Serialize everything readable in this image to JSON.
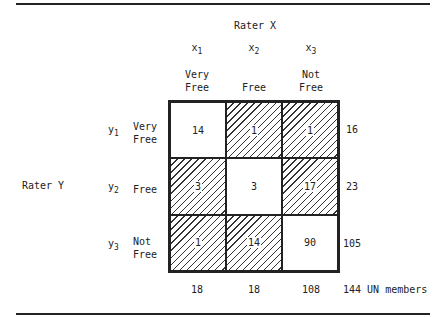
{
  "rater_x": {
    "label": "Rater X"
  },
  "rater_y": {
    "label": "Rater Y"
  },
  "columns": [
    {
      "var": "x",
      "sub": "1",
      "label1": "Very",
      "label2": "Free"
    },
    {
      "var": "x",
      "sub": "2",
      "label1": "",
      "label2": "Free"
    },
    {
      "var": "x",
      "sub": "3",
      "label1": "Not",
      "label2": "Free"
    }
  ],
  "rows": [
    {
      "var": "y",
      "sub": "1",
      "label1": "Very",
      "label2": "Free",
      "total": "16"
    },
    {
      "var": "y",
      "sub": "2",
      "label1": "",
      "label2": "Free",
      "total": "23"
    },
    {
      "var": "y",
      "sub": "3",
      "label1": "Not",
      "label2": "Free",
      "total": "105"
    }
  ],
  "cells": [
    [
      "14",
      "1",
      "1"
    ],
    [
      "3",
      "3",
      "17"
    ],
    [
      "1",
      "14",
      "90"
    ]
  ],
  "column_totals": [
    "18",
    "18",
    "108"
  ],
  "grand_total": "144 UN members"
}
